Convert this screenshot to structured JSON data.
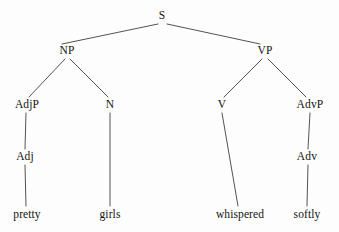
{
  "diagram": {
    "type": "constituency-syntax-tree",
    "sentence": "pretty girls whispered softly",
    "background_color": "#fdfdfd",
    "line_color": "#3f3f3a",
    "text_color": "#14140f",
    "nodes": [
      {
        "id": "S",
        "label": "S",
        "x": 162,
        "y": 16,
        "kind": "nonterminal"
      },
      {
        "id": "NP",
        "label": "NP",
        "x": 67,
        "y": 51,
        "kind": "nonterminal"
      },
      {
        "id": "VP",
        "label": "VP",
        "x": 265,
        "y": 51,
        "kind": "nonterminal"
      },
      {
        "id": "AdjP",
        "label": "AdjP",
        "x": 27,
        "y": 105,
        "kind": "nonterminal"
      },
      {
        "id": "N",
        "label": "N",
        "x": 110,
        "y": 105,
        "kind": "nonterminal"
      },
      {
        "id": "V",
        "label": "V",
        "x": 222,
        "y": 105,
        "kind": "nonterminal"
      },
      {
        "id": "AdvP",
        "label": "AdvP",
        "x": 310,
        "y": 105,
        "kind": "nonterminal"
      },
      {
        "id": "Adj",
        "label": "Adj",
        "x": 25,
        "y": 157,
        "kind": "nonterminal"
      },
      {
        "id": "Adv",
        "label": "Adv",
        "x": 307,
        "y": 157,
        "kind": "nonterminal"
      }
    ],
    "leaves": [
      {
        "id": "pretty",
        "label": "pretty",
        "x": 27,
        "y": 215
      },
      {
        "id": "girls",
        "label": "girls",
        "x": 110,
        "y": 215
      },
      {
        "id": "whispered",
        "label": "whispered",
        "x": 240,
        "y": 215
      },
      {
        "id": "softly",
        "label": "softly",
        "x": 307,
        "y": 215
      }
    ],
    "edges": [
      {
        "from": "S",
        "to": "NP",
        "x1": 158,
        "y1": 24,
        "x2": 62,
        "y2": 44
      },
      {
        "from": "S",
        "to": "VP",
        "x1": 167,
        "y1": 24,
        "x2": 260,
        "y2": 44
      },
      {
        "from": "NP",
        "to": "AdjP",
        "x1": 65,
        "y1": 59,
        "x2": 29,
        "y2": 97
      },
      {
        "from": "NP",
        "to": "N",
        "x1": 70,
        "y1": 59,
        "x2": 108,
        "y2": 97
      },
      {
        "from": "VP",
        "to": "V",
        "x1": 262,
        "y1": 59,
        "x2": 224,
        "y2": 97
      },
      {
        "from": "VP",
        "to": "AdvP",
        "x1": 268,
        "y1": 59,
        "x2": 306,
        "y2": 97
      },
      {
        "from": "AdjP",
        "to": "Adj",
        "x1": 26,
        "y1": 113,
        "x2": 25,
        "y2": 149
      },
      {
        "from": "Adj",
        "to": "pretty",
        "x1": 25,
        "y1": 165,
        "x2": 26,
        "y2": 206
      },
      {
        "from": "N",
        "to": "girls",
        "x1": 110,
        "y1": 113,
        "x2": 110,
        "y2": 206
      },
      {
        "from": "V",
        "to": "whispered",
        "x1": 222,
        "y1": 113,
        "x2": 238,
        "y2": 206
      },
      {
        "from": "AdvP",
        "to": "Adv",
        "x1": 310,
        "y1": 113,
        "x2": 308,
        "y2": 149
      },
      {
        "from": "Adv",
        "to": "softly",
        "x1": 308,
        "y1": 165,
        "x2": 307,
        "y2": 206
      }
    ]
  }
}
